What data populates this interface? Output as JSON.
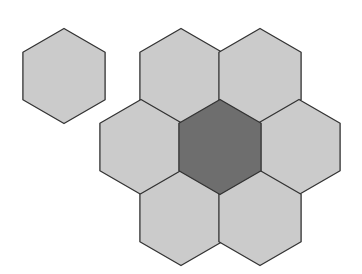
{
  "diagram": {
    "type": "hexagonal-cell-cluster",
    "colors": {
      "background": "#ffffff",
      "light_fill": "#cbcbcb",
      "dark_fill": "#6e6e6e",
      "stroke": "#333333"
    },
    "hex_radius": 47.5,
    "cells": [
      {
        "id": "standalone",
        "cx": 64,
        "cy": 76,
        "fill": "light"
      },
      {
        "id": "cluster-top-left",
        "cx": 181,
        "cy": 76,
        "fill": "light"
      },
      {
        "id": "cluster-top-right",
        "cx": 260,
        "cy": 76,
        "fill": "light"
      },
      {
        "id": "cluster-left",
        "cx": 141,
        "cy": 147,
        "fill": "light"
      },
      {
        "id": "cluster-center",
        "cx": 220,
        "cy": 147,
        "fill": "dark"
      },
      {
        "id": "cluster-right",
        "cx": 299,
        "cy": 147,
        "fill": "light"
      },
      {
        "id": "cluster-bottom-left",
        "cx": 181,
        "cy": 218,
        "fill": "light"
      },
      {
        "id": "cluster-bottom-right",
        "cx": 260,
        "cy": 218,
        "fill": "light"
      }
    ]
  }
}
